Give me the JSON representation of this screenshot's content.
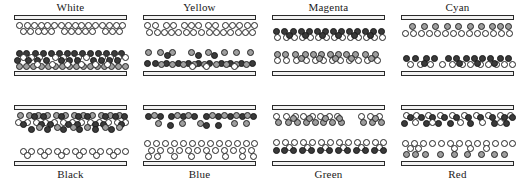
{
  "figure": {
    "title": "",
    "particle_types": {
      "white": {
        "label": "white particle",
        "color": "#ffffff"
      },
      "gray": {
        "label": "gray particle",
        "color": "#9e9e9e"
      },
      "dark": {
        "label": "dark particle",
        "color": "#3a3a3a"
      }
    },
    "structure": {
      "rows": 2,
      "columns": 4,
      "plate_color": "#f2f2f2",
      "outline_color": "#242424"
    }
  },
  "panels": [
    {
      "id": "white",
      "label": "White",
      "label_position": "top",
      "row": 0,
      "col": 0,
      "bands": [
        {
          "type": "white",
          "y": 2,
          "xs": [
            2,
            10,
            17,
            24,
            30,
            37,
            44,
            51,
            58,
            64,
            71,
            78,
            85,
            92,
            99,
            105
          ]
        },
        {
          "type": "white",
          "y": 8,
          "xs": [
            6,
            13,
            21,
            27,
            34,
            47,
            54,
            61,
            68,
            75,
            88,
            95,
            102
          ]
        },
        {
          "type": "dark",
          "y": 30,
          "xs": [
            2,
            9,
            18,
            26,
            34,
            42,
            50,
            57,
            65,
            73,
            81,
            89,
            97,
            104
          ]
        },
        {
          "type": "white",
          "y": 34,
          "xs": [
            6,
            14,
            22,
            38,
            46,
            61,
            69,
            85,
            93,
            101,
            108
          ]
        },
        {
          "type": "dark",
          "y": 37,
          "xs": [
            0,
            11,
            20,
            29,
            44,
            52,
            60,
            76,
            84,
            92,
            100
          ]
        },
        {
          "type": "gray",
          "y": 43,
          "xs": [
            2,
            9,
            16,
            24,
            31,
            38,
            45,
            52,
            59,
            66,
            73,
            80,
            87,
            94,
            101,
            108
          ]
        },
        {
          "type": "white",
          "y": 41,
          "xs": [
            20,
            35,
            50,
            64,
            78,
            90
          ]
        }
      ]
    },
    {
      "id": "yellow",
      "label": "Yellow",
      "label_position": "top",
      "row": 0,
      "col": 1,
      "bands": [
        {
          "type": "white",
          "y": 2,
          "xs": [
            1,
            9,
            20,
            27,
            38,
            45,
            52,
            62,
            69,
            79,
            86,
            93,
            101,
            108
          ]
        },
        {
          "type": "white",
          "y": 9,
          "xs": [
            3,
            11,
            18,
            25,
            32,
            40,
            47,
            55,
            63,
            70,
            77,
            84,
            92,
            99,
            106
          ]
        },
        {
          "type": "gray",
          "y": 29,
          "xs": [
            2,
            14,
            26,
            45,
            62,
            78,
            90,
            104
          ]
        },
        {
          "type": "dark",
          "y": 32,
          "xs": [
            21,
            52,
            68
          ]
        },
        {
          "type": "dark",
          "y": 40,
          "xs": [
            1,
            9,
            20,
            32,
            42,
            52,
            63,
            75,
            84,
            95,
            106
          ]
        },
        {
          "type": "gray",
          "y": 41,
          "xs": [
            15,
            26,
            37,
            48,
            58,
            70,
            80,
            90,
            100
          ]
        },
        {
          "type": "white",
          "y": 43,
          "xs": [
            46,
            60,
            88
          ]
        }
      ]
    },
    {
      "id": "magenta",
      "label": "Magenta",
      "label_position": "top",
      "row": 0,
      "col": 2,
      "bands": [
        {
          "type": "dark",
          "y": 8,
          "xs": [
            1,
            9,
            18,
            26,
            34,
            42,
            50,
            58,
            66,
            74,
            82,
            90,
            98,
            106
          ]
        },
        {
          "type": "white",
          "y": 14,
          "xs": [
            2,
            11,
            19,
            27,
            35,
            43,
            51,
            59,
            67,
            75,
            83,
            91,
            99,
            107
          ]
        },
        {
          "type": "dark",
          "y": 12,
          "xs": [
            14,
            30,
            47,
            63,
            79,
            95
          ]
        },
        {
          "type": "gray",
          "y": 31,
          "xs": [
            2,
            10,
            20,
            30,
            38,
            46,
            55,
            63,
            71,
            80,
            90,
            100
          ]
        },
        {
          "type": "white",
          "y": 37,
          "xs": [
            2,
            11,
            21,
            31,
            40,
            48,
            57,
            65,
            74,
            83,
            92,
            102
          ]
        },
        {
          "type": "gray",
          "y": 35,
          "xs": [
            26,
            44,
            60,
            76,
            96
          ]
        }
      ]
    },
    {
      "id": "cyan",
      "label": "Cyan",
      "label_position": "top",
      "row": 0,
      "col": 3,
      "bands": [
        {
          "type": "gray",
          "y": 3,
          "xs": [
            8,
            20,
            31,
            43,
            54,
            66,
            77,
            88,
            96,
            104
          ]
        },
        {
          "type": "white",
          "y": 10,
          "xs": [
            1,
            9,
            17,
            25,
            33,
            41,
            49,
            57,
            65,
            73,
            81,
            89,
            97,
            105
          ]
        },
        {
          "type": "dark",
          "y": 35,
          "xs": [
            2,
            11,
            22,
            30,
            44,
            52,
            62,
            70,
            78,
            86,
            96,
            104
          ]
        },
        {
          "type": "white",
          "y": 41,
          "xs": [
            6,
            16,
            26,
            38,
            48,
            58,
            66,
            76,
            84,
            92,
            100,
            108
          ]
        },
        {
          "type": "dark",
          "y": 40,
          "xs": [
            20,
            55,
            73,
            90
          ]
        }
      ]
    },
    {
      "id": "black",
      "label": "Black",
      "label_position": "bottom",
      "row": 1,
      "col": 0,
      "bands": [
        {
          "type": "gray",
          "y": 2,
          "xs": [
            3,
            12,
            21,
            30,
            39,
            48,
            57,
            66,
            75,
            84,
            93,
            102
          ]
        },
        {
          "type": "dark",
          "y": 3,
          "xs": [
            17,
            26,
            44,
            61,
            70,
            88,
            98,
            107
          ]
        },
        {
          "type": "white",
          "y": 9,
          "xs": [
            1,
            10,
            19,
            28,
            37,
            46,
            55,
            64,
            73,
            82,
            91,
            100,
            108
          ]
        },
        {
          "type": "dark",
          "y": 11,
          "xs": [
            6,
            24,
            33,
            51,
            60,
            78,
            86,
            104
          ]
        },
        {
          "type": "dark",
          "y": 16,
          "xs": [
            14,
            30,
            46,
            62,
            78,
            94
          ]
        },
        {
          "type": "gray",
          "y": 14,
          "xs": [
            22,
            40,
            56,
            70,
            88,
            102
          ]
        },
        {
          "type": "white",
          "y": 38,
          "xs": [
            6,
            14,
            23,
            31,
            40,
            49,
            58,
            66,
            75,
            83,
            92,
            100,
            108
          ]
        },
        {
          "type": "white",
          "y": 42,
          "xs": [
            10,
            27,
            44,
            62,
            79,
            96
          ]
        }
      ]
    },
    {
      "id": "blue",
      "label": "Blue",
      "label_position": "bottom",
      "row": 1,
      "col": 1,
      "bands": [
        {
          "type": "dark",
          "y": 3,
          "xs": [
            2,
            14,
            25,
            37,
            48,
            60,
            72,
            84,
            96,
            107
          ]
        },
        {
          "type": "gray",
          "y": 2,
          "xs": [
            8,
            31,
            42,
            66,
            78,
            90,
            101
          ]
        },
        {
          "type": "gray",
          "y": 10,
          "xs": [
            12,
            36,
            54,
            88,
            100
          ]
        },
        {
          "type": "dark",
          "y": 12,
          "xs": [
            24,
            60,
            72
          ]
        },
        {
          "type": "white",
          "y": 30,
          "xs": [
            1,
            10,
            19,
            28,
            37,
            46,
            55,
            64,
            73,
            82,
            91,
            100,
            108
          ]
        },
        {
          "type": "white",
          "y": 37,
          "xs": [
            5,
            14,
            24,
            33,
            42,
            51,
            60,
            69,
            78,
            87,
            96,
            105
          ]
        },
        {
          "type": "white",
          "y": 43,
          "xs": [
            2,
            11,
            28,
            45,
            62,
            79,
            96,
            107
          ]
        }
      ]
    },
    {
      "id": "green",
      "label": "Green",
      "label_position": "bottom",
      "row": 1,
      "col": 2,
      "bands": [
        {
          "type": "white",
          "y": 3,
          "xs": [
            1,
            11,
            20,
            28,
            37,
            45,
            54,
            62,
            86,
            95,
            104
          ]
        },
        {
          "type": "gray",
          "y": 9,
          "xs": [
            3,
            13,
            22,
            31,
            40,
            48,
            57,
            66,
            88,
            97,
            106
          ]
        },
        {
          "type": "gray",
          "y": 5,
          "xs": [
            18,
            34,
            50,
            64,
            100
          ]
        },
        {
          "type": "white",
          "y": 29,
          "xs": [
            1,
            10,
            19,
            28,
            37,
            46,
            55,
            64,
            73,
            82,
            91,
            100,
            108
          ]
        },
        {
          "type": "white",
          "y": 34,
          "xs": [
            14,
            32,
            50,
            68,
            86,
            104
          ]
        },
        {
          "type": "dark",
          "y": 37,
          "xs": [
            1,
            9,
            18,
            27,
            36,
            45,
            54,
            63,
            72,
            81,
            90,
            99,
            108
          ]
        }
      ]
    },
    {
      "id": "red",
      "label": "Red",
      "label_position": "bottom",
      "row": 1,
      "col": 3,
      "bands": [
        {
          "type": "white",
          "y": 2,
          "xs": [
            2,
            12,
            24,
            36,
            48,
            60,
            72,
            84,
            96,
            106
          ]
        },
        {
          "type": "dark",
          "y": 4,
          "xs": [
            6,
            17,
            28,
            40,
            52,
            64,
            76,
            88,
            100,
            108
          ]
        },
        {
          "type": "dark",
          "y": 10,
          "xs": [
            0,
            22,
            34,
            46,
            66,
            90,
            102
          ]
        },
        {
          "type": "white",
          "y": 9,
          "xs": [
            11,
            28,
            56,
            78,
            96
          ]
        },
        {
          "type": "white",
          "y": 30,
          "xs": [
            1,
            10,
            19,
            28,
            37,
            46,
            55,
            64,
            73,
            82,
            91,
            100,
            108
          ]
        },
        {
          "type": "white",
          "y": 35,
          "xs": [
            6,
            14,
            50,
            66,
            82
          ]
        },
        {
          "type": "gray",
          "y": 41,
          "xs": [
            2,
            11,
            21,
            36,
            50,
            63,
            77,
            90,
            100
          ]
        }
      ]
    }
  ]
}
